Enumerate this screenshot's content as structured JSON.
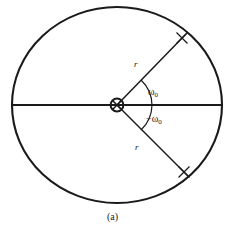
{
  "figure": {
    "caption": "(a)",
    "type": "pole-zero-plot",
    "colors": {
      "stroke": "#1a1a1a",
      "background": "#ffffff"
    },
    "labels": {
      "radius_upper": "r",
      "radius_lower": "r",
      "angle_positive": "ω",
      "angle_positive_sub": "0",
      "angle_negative": "−ω",
      "angle_negative_sub": "0"
    },
    "geometry": {
      "circle_center_x": 117,
      "circle_center_y": 105,
      "circle_radius_x": 105,
      "circle_radius_y": 98,
      "pole_upper_x": 182,
      "pole_upper_y": 38,
      "pole_lower_x": 184,
      "pole_lower_y": 172,
      "origin_marker": "circle-with-x",
      "angle_degrees": 45
    },
    "elements": {
      "unit_circle": "unit-circle",
      "real_axis": "real-axis-line",
      "origin_pole": "origin-double-pole",
      "arc_positive": "angle-arc-positive",
      "arc_negative": "angle-arc-negative",
      "pole_marker_upper": "pole-x-marker-upper",
      "pole_marker_lower": "pole-x-marker-lower"
    }
  }
}
